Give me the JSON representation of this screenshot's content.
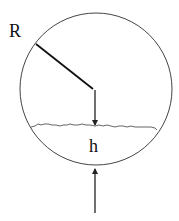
{
  "diagram": {
    "labels": {
      "radius": "R",
      "height": "h"
    },
    "colors": {
      "stroke": "#222222",
      "background": "#ffffff"
    }
  }
}
